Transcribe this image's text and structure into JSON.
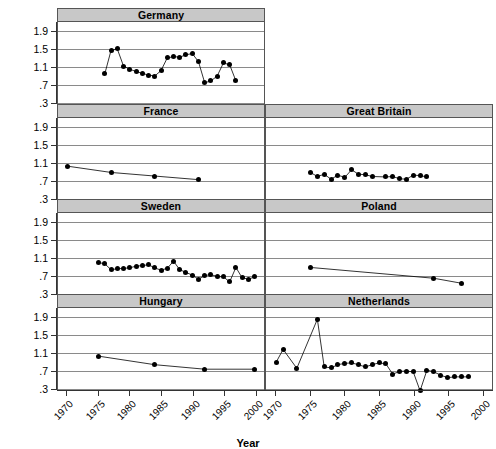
{
  "chart_data": {
    "type": "line",
    "title": "",
    "xlabel": "Year",
    "ylabel": "",
    "xlim": [
      1968.5,
      2001.5
    ],
    "ylim": [
      0.3,
      2.1
    ],
    "yticks": [
      "1.9",
      "1.5",
      "1.1",
      ".7",
      ".3"
    ],
    "ytick_values": [
      1.9,
      1.5,
      1.1,
      0.7,
      0.3
    ],
    "xticks": [
      "1970",
      "1975",
      "1980",
      "1985",
      "1990",
      "1995",
      "2000"
    ],
    "xtick_values": [
      1970,
      1975,
      1980,
      1985,
      1990,
      1995,
      2000
    ],
    "grid": true,
    "legend": "none",
    "layout": "trellis 4 rows x 2 columns; top-right cell empty",
    "panels": [
      {
        "name": "Germany",
        "row": 1,
        "col": "full-left",
        "x": [
          1976,
          1977,
          1978,
          1979,
          1980,
          1981,
          1982,
          1983,
          1984,
          1985,
          1986,
          1987,
          1988,
          1989,
          1990,
          1991,
          1992,
          1993,
          1994,
          1995,
          1996,
          1997
        ],
        "y": [
          0.95,
          1.47,
          1.5,
          1.12,
          1.05,
          1.0,
          0.96,
          0.92,
          0.9,
          1.02,
          1.3,
          1.33,
          1.32,
          1.37,
          1.4,
          1.22,
          0.75,
          0.79,
          0.9,
          1.19,
          1.15,
          0.79
        ]
      },
      {
        "name": "France",
        "row": 2,
        "col": "left",
        "x": [
          1970,
          1977,
          1984,
          1991
        ],
        "y": [
          1.03,
          0.89,
          0.81,
          0.73
        ]
      },
      {
        "name": "Great Britain",
        "row": 2,
        "col": "right",
        "x": [
          1975,
          1976,
          1977,
          1978,
          1979,
          1980,
          1981,
          1982,
          1983,
          1984,
          1986,
          1987,
          1988,
          1989,
          1990,
          1991,
          1992
        ],
        "y": [
          0.89,
          0.8,
          0.85,
          0.74,
          0.83,
          0.78,
          0.95,
          0.85,
          0.84,
          0.8,
          0.79,
          0.8,
          0.75,
          0.74,
          0.83,
          0.82,
          0.79
        ]
      },
      {
        "name": "Sweden",
        "row": 3,
        "col": "left",
        "x": [
          1975,
          1976,
          1977,
          1978,
          1979,
          1980,
          1981,
          1982,
          1983,
          1984,
          1985,
          1986,
          1987,
          1988,
          1989,
          1990,
          1991,
          1992,
          1993,
          1994,
          1995,
          1996,
          1997,
          1998,
          1999,
          2000
        ],
        "y": [
          1.0,
          0.97,
          0.84,
          0.86,
          0.87,
          0.88,
          0.92,
          0.93,
          0.95,
          0.88,
          0.83,
          0.87,
          1.03,
          0.84,
          0.78,
          0.72,
          0.63,
          0.71,
          0.73,
          0.69,
          0.68,
          0.57,
          0.89,
          0.66,
          0.63,
          0.68
        ]
      },
      {
        "name": "Poland",
        "row": 3,
        "col": "right",
        "x": [
          1975,
          1993,
          1997
        ],
        "y": [
          0.89,
          0.65,
          0.54
        ]
      },
      {
        "name": "Hungary",
        "row": 4,
        "col": "left",
        "x": [
          1975,
          1984,
          1992,
          2000
        ],
        "y": [
          1.03,
          0.84,
          0.74,
          0.74
        ]
      },
      {
        "name": "Netherlands",
        "row": 4,
        "col": "right",
        "x": [
          1970,
          1971,
          1973,
          1976,
          1977,
          1978,
          1979,
          1980,
          1981,
          1982,
          1983,
          1984,
          1985,
          1986,
          1987,
          1988,
          1989,
          1990,
          1991,
          1992,
          1993,
          1994,
          1995,
          1996,
          1997,
          1998
        ],
        "y": [
          0.9,
          1.18,
          0.76,
          1.85,
          0.79,
          0.77,
          0.84,
          0.87,
          0.88,
          0.84,
          0.79,
          0.84,
          0.88,
          0.86,
          0.63,
          0.69,
          0.7,
          0.68,
          0.26,
          0.72,
          0.68,
          0.61,
          0.55,
          0.57,
          0.57,
          0.57
        ]
      }
    ]
  }
}
